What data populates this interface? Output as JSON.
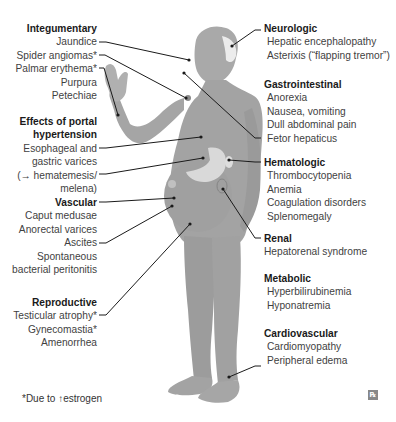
{
  "diagram": {
    "colors": {
      "body": "#9a9a9a",
      "body_light": "#b4b4b4",
      "organ_highlight": "#d6d6d6",
      "hair": "#e8e8e8",
      "leader_line": "#1a1a1a",
      "title_text": "#1a1a1a",
      "item_text": "#3f3f3f"
    },
    "left_groups": [
      {
        "title": "Integumentary",
        "items": [
          "Jaundice",
          "Spider angiomas*",
          "Palmar erythema*",
          "Purpura",
          "Petechiae"
        ]
      },
      {
        "title_lines": [
          "Effects of portal",
          "hypertension"
        ],
        "items": [
          "Esophageal and",
          "gastric varices",
          "(→ hematemesis/",
          "melena)"
        ]
      },
      {
        "title": "Vascular",
        "items": [
          "Caput medusae",
          "Anorectal varices",
          "Ascites",
          "Spontaneous",
          "bacterial peritonitis"
        ]
      },
      {
        "title": "Reproductive",
        "items": [
          "Testicular atrophy*",
          "Gynecomastia*",
          "Amenorrhea"
        ]
      }
    ],
    "right_groups": [
      {
        "title": "Neurologic",
        "items": [
          "Hepatic encephalopathy",
          "Asterixis (“flapping tremor”)"
        ]
      },
      {
        "title": "Gastrointestinal",
        "items": [
          "Anorexia",
          "Nausea, vomiting",
          "Dull abdominal pain",
          "Fetor hepaticus"
        ]
      },
      {
        "title": "Hematologic",
        "items": [
          "Thrombocytopenia",
          "Anemia",
          "Coagulation disorders",
          "Splenomegaly"
        ]
      },
      {
        "title": "Renal",
        "items": [
          "Hepatorenal syndrome"
        ]
      },
      {
        "title": "Metabolic",
        "items": [
          "Hyperbilirubinemia",
          "Hyponatremia"
        ]
      },
      {
        "title": "Cardiovascular",
        "items": [
          "Cardiomyopathy",
          "Peripheral edema"
        ]
      }
    ],
    "footnote": "*Due to ↑estrogen",
    "logo_glyph": "℞"
  }
}
